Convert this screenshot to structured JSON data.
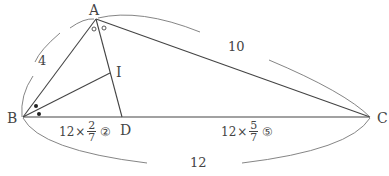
{
  "diagram": {
    "points": {
      "A": {
        "label": "A",
        "x": 96,
        "y": 19
      },
      "B": {
        "label": "B",
        "x": 23,
        "y": 117
      },
      "C": {
        "label": "C",
        "x": 370,
        "y": 117
      },
      "D": {
        "label": "D",
        "x": 122,
        "y": 117
      },
      "I": {
        "label": "I",
        "x": 110,
        "y": 73
      }
    },
    "lengths": {
      "AB": "4",
      "AC": "10",
      "BC": "12"
    },
    "segments": {
      "BD": {
        "coef": "12",
        "times": "×",
        "num": "2",
        "den": "7",
        "ratio": "②"
      },
      "DC": {
        "coef": "12",
        "times": "×",
        "num": "5",
        "den": "7",
        "ratio": "⑤"
      }
    },
    "angle_marks": {
      "A": "open-circle",
      "B": "filled-dot"
    },
    "colors": {
      "line": "#444444",
      "arc": "#777777",
      "text": "#444444"
    }
  }
}
